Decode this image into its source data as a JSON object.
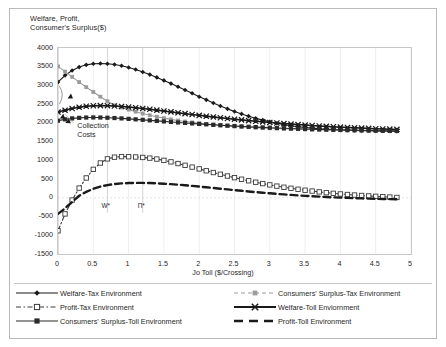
{
  "chart_data": {
    "type": "line",
    "title": "",
    "ylabel": "Welfare, Profit,\nConsumer's Surplus($)",
    "xlabel": "Jo Toll ($/Crossing)",
    "xlim": [
      0,
      5
    ],
    "ylim": [
      -1500,
      4000
    ],
    "xticks": [
      "0",
      "0.5",
      "1",
      "1.5",
      "2",
      "2.5",
      "3",
      "3.5",
      "4",
      "4.5",
      "5"
    ],
    "yticks": [
      "4000",
      "3500",
      "3000",
      "2500",
      "2000",
      "1500",
      "1000",
      "500",
      "0",
      "-500",
      "-1000",
      "-1500"
    ],
    "grid": "vertical-light",
    "legend_position": "bottom",
    "annotations": [
      {
        "text": "Collection\nCosts",
        "x": 0.23,
        "y": 1950
      },
      {
        "text": "W*",
        "x": 0.7,
        "y": -250
      },
      {
        "text": "Π*",
        "x": 1.2,
        "y": -250
      }
    ],
    "vertical_markers": [
      0.7,
      1.2
    ],
    "x": [
      0,
      0.1,
      0.2,
      0.3,
      0.4,
      0.5,
      0.6,
      0.7,
      0.8,
      0.9,
      1.0,
      1.1,
      1.2,
      1.3,
      1.4,
      1.5,
      1.6,
      1.7,
      1.8,
      1.9,
      2.0,
      2.1,
      2.2,
      2.3,
      2.4,
      2.5,
      2.6,
      2.7,
      2.8,
      2.9,
      3.0,
      3.1,
      3.2,
      3.3,
      3.4,
      3.5,
      3.6,
      3.7,
      3.8,
      3.9,
      4.0,
      4.1,
      4.2,
      4.3,
      4.4,
      4.5,
      4.6,
      4.7,
      4.8
    ],
    "series": [
      {
        "name": "Welfare-Tax Environment",
        "marker": "diamond",
        "style": "solid",
        "color": "#1a1a1a",
        "values": [
          3090,
          3270,
          3400,
          3490,
          3550,
          3580,
          3585,
          3580,
          3560,
          3525,
          3480,
          3425,
          3360,
          3290,
          3215,
          3135,
          3050,
          2965,
          2880,
          2790,
          2700,
          2615,
          2530,
          2450,
          2375,
          2305,
          2240,
          2180,
          2125,
          2075,
          2030,
          1990,
          1955,
          1925,
          1900,
          1878,
          1860,
          1845,
          1832,
          1822,
          1813,
          1806,
          1800,
          1795,
          1791,
          1788,
          1785,
          1783,
          1781
        ]
      },
      {
        "name": "Consumers' Surplus-Tax Environment",
        "marker": "square",
        "style": "solid",
        "color": "#9a9a9a",
        "values": [
          3510,
          3370,
          3230,
          3090,
          2955,
          2825,
          2700,
          2580,
          2470,
          2410,
          2355,
          2300,
          2250,
          2205,
          2165,
          2128,
          2095,
          2065,
          2038,
          2013,
          1990,
          1970,
          1952,
          1936,
          1921,
          1908,
          1896,
          1885,
          1875,
          1866,
          1858,
          1851,
          1844,
          1838,
          1833,
          1828,
          1824,
          1820,
          1816,
          1813,
          1810,
          1807,
          1805,
          1803,
          1801,
          1799,
          1797,
          1796,
          1795
        ]
      },
      {
        "name": "Profit-Tax Environment",
        "marker": "open-square",
        "style": "dashdot",
        "color": "#3a3a3a",
        "values": [
          -880,
          -430,
          -60,
          260,
          530,
          760,
          930,
          1040,
          1085,
          1100,
          1098,
          1090,
          1078,
          1060,
          1035,
          1000,
          960,
          915,
          868,
          820,
          772,
          722,
          675,
          628,
          582,
          538,
          496,
          455,
          417,
          380,
          345,
          312,
          282,
          254,
          228,
          203,
          180,
          158,
          138,
          120,
          103,
          88,
          74,
          62,
          50,
          40,
          30,
          20,
          10
        ]
      },
      {
        "name": "Welfare-Toll Enviornment",
        "marker": "cross",
        "style": "solid",
        "color": "#1a1a1a",
        "values": [
          2290,
          2340,
          2385,
          2420,
          2445,
          2458,
          2462,
          2460,
          2452,
          2440,
          2424,
          2406,
          2386,
          2364,
          2341,
          2318,
          2294,
          2270,
          2247,
          2224,
          2202,
          2180,
          2159,
          2138,
          2118,
          2099,
          2080,
          2062,
          2045,
          2028,
          2012,
          1997,
          1982,
          1968,
          1955,
          1942,
          1930,
          1918,
          1907,
          1897,
          1887,
          1878,
          1869,
          1861,
          1853,
          1846,
          1839,
          1833,
          1827
        ]
      },
      {
        "name": "Consumers' Surplus-Toll Environment",
        "marker": "filled-square",
        "style": "solid",
        "color": "#2a2a2a",
        "values": [
          2060,
          2095,
          2120,
          2135,
          2143,
          2146,
          2144,
          2138,
          2130,
          2120,
          2108,
          2095,
          2082,
          2068,
          2054,
          2040,
          2026,
          2012,
          1999,
          1986,
          1973,
          1961,
          1949,
          1938,
          1927,
          1917,
          1907,
          1897,
          1888,
          1880,
          1872,
          1864,
          1857,
          1850,
          1843,
          1837,
          1831,
          1826,
          1821,
          1816,
          1811,
          1807,
          1803,
          1799,
          1796,
          1793,
          1790,
          1787,
          1785
        ]
      },
      {
        "name": "Profit-Toll Environment",
        "marker": "none",
        "style": "dashed",
        "color": "#1a1a1a",
        "values": [
          -430,
          -280,
          -110,
          55,
          160,
          240,
          300,
          340,
          368,
          385,
          394,
          398,
          398,
          394,
          387,
          377,
          365,
          351,
          335,
          318,
          300,
          281,
          262,
          243,
          224,
          205,
          187,
          169,
          152,
          136,
          120,
          105,
          91,
          78,
          65,
          53,
          42,
          32,
          22,
          13,
          5,
          -2,
          -9,
          -15,
          -21,
          -26,
          -31,
          -35,
          -39
        ]
      }
    ]
  },
  "legend": {
    "items": [
      {
        "label": "Welfare-Tax Environment",
        "key": "diamond-solid"
      },
      {
        "label": "Consumers' Surplus-Tax Environment",
        "key": "square-dash-gray"
      },
      {
        "label": "Profit-Tax Environment",
        "key": "opensquare-dashdot"
      },
      {
        "label": "Welfare-Toll Enviornment",
        "key": "cross-solid-bold"
      },
      {
        "label": "Consumers' Surplus-Toll Environment",
        "key": "filledsquare-solid"
      },
      {
        "label": "Profit-Toll Environment",
        "key": "thick-dashed"
      }
    ]
  }
}
